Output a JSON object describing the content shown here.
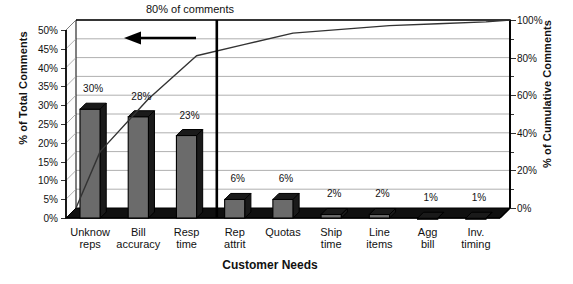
{
  "chart_data": {
    "type": "bar",
    "title": "",
    "annotation": "80% of comments",
    "annotation_arrow": "left-arrow",
    "xlabel": "Customer Needs",
    "ylabel": "% of Total Comments",
    "ylabel_right": "% of Cumulative Comments",
    "categories": [
      "Unknow reps",
      "Bill accuracy",
      "Resp time",
      "Rep attrit",
      "Quotas",
      "Ship time",
      "Line items",
      "Agg bill",
      "Inv. timing"
    ],
    "category_lines": [
      [
        "Unknow",
        "reps"
      ],
      [
        "Bill",
        "accuracy"
      ],
      [
        "Resp",
        "time"
      ],
      [
        "Rep",
        "attrit"
      ],
      [
        "Quotas",
        ""
      ],
      [
        "Ship",
        "time"
      ],
      [
        "Line",
        "items"
      ],
      [
        "Agg",
        "bill"
      ],
      [
        "Inv.",
        "timing"
      ]
    ],
    "values": [
      30,
      28,
      23,
      6,
      6,
      2,
      2,
      1,
      1
    ],
    "data_labels": [
      "30%",
      "28%",
      "23%",
      "6%",
      "6%",
      "2%",
      "2%",
      "1%",
      "1%"
    ],
    "series": [
      {
        "name": "% of Total Comments",
        "type": "bar",
        "values": [
          30,
          28,
          23,
          6,
          6,
          2,
          2,
          1,
          1
        ]
      },
      {
        "name": "% of Cumulative Comments",
        "type": "line",
        "values": [
          30,
          58,
          81,
          87,
          93,
          95,
          97,
          98,
          99
        ]
      }
    ],
    "ylim": [
      0,
      50
    ],
    "ylim_right": [
      0,
      100
    ],
    "ytick_labels": [
      "0%",
      "5%",
      "10%",
      "15%",
      "20%",
      "25%",
      "30%",
      "35%",
      "40%",
      "45%",
      "50%"
    ],
    "ytick_values": [
      0,
      5,
      10,
      15,
      20,
      25,
      30,
      35,
      40,
      45,
      50
    ],
    "ytick_labels_right": [
      "0%",
      "20%",
      "40%",
      "60%",
      "80%",
      "100%"
    ],
    "ytick_values_right": [
      0,
      20,
      40,
      60,
      80,
      100
    ],
    "ytick_minor_right": [
      10,
      30,
      50,
      70,
      90
    ],
    "grid": true,
    "legend": "none",
    "style_3d": true,
    "bar_color": "#6b6b6b",
    "bar_top_color": "#1a1a1a",
    "line_color": "#333333",
    "axis_color": "#000000",
    "grid_color": "#9a9a9a",
    "cutoff_line_after_category": "Resp time",
    "cutoff_line_value_pct": 80
  }
}
